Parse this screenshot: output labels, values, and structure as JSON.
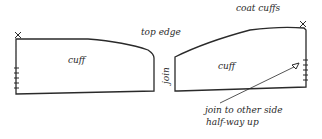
{
  "diagram": {
    "title": "coat cuffs",
    "labels": {
      "top_edge": "top edge",
      "join": "join",
      "left_cuff": "cuff",
      "right_cuff": "cuff",
      "note_line1": "join to other side",
      "note_line2": "half-way up"
    },
    "colors": {
      "line": "#2a2a2a",
      "background": "#ffffff"
    },
    "markers": {
      "left_corner": "x",
      "right_corner": "x",
      "arrow_target": "triangle"
    }
  }
}
